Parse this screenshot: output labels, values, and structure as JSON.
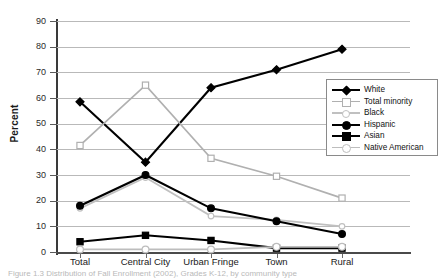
{
  "chart_data": {
    "type": "line",
    "title": "",
    "xlabel": "",
    "ylabel": "Percent",
    "ylim": [
      0,
      90
    ],
    "ytick_step": 10,
    "yticks": [
      0,
      10,
      20,
      30,
      40,
      50,
      60,
      70,
      80,
      90
    ],
    "grid": true,
    "legend_position": "right-upper",
    "categories": [
      "Total",
      "Central City",
      "Urban Fringe",
      "Town",
      "Rural"
    ],
    "series": [
      {
        "name": "White",
        "values": [
          58.5,
          35.0,
          64.0,
          71.0,
          79.0
        ],
        "color": "#000000",
        "marker": "diamond-filled"
      },
      {
        "name": "Total minority",
        "values": [
          41.5,
          65.0,
          36.5,
          29.5,
          21.0
        ],
        "color": "#b0b0b0",
        "marker": "square-open"
      },
      {
        "name": "Black",
        "values": [
          17.0,
          29.0,
          14.0,
          12.5,
          10.0
        ],
        "color": "#c0c0c0",
        "marker": "circle-open-small"
      },
      {
        "name": "Hispanic",
        "values": [
          18.0,
          30.0,
          17.0,
          12.0,
          7.0
        ],
        "color": "#000000",
        "marker": "circle-filled"
      },
      {
        "name": "Asian",
        "values": [
          4.0,
          6.5,
          4.5,
          1.5,
          1.5
        ],
        "color": "#000000",
        "marker": "square-filled"
      },
      {
        "name": "Native American",
        "values": [
          1.0,
          1.0,
          1.0,
          2.0,
          2.0
        ],
        "color": "#bdbdbd",
        "marker": "circle-open"
      }
    ]
  },
  "caption": "Figure 1.3   Distribution of Fall Enrollment (2002), Grades K-12, by community type"
}
